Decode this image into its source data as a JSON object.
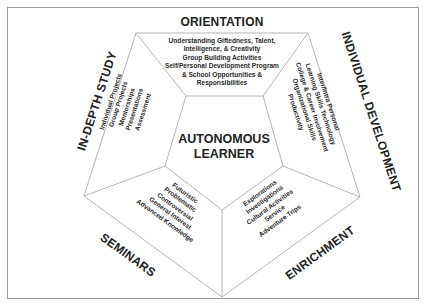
{
  "diagram": {
    "type": "pentagon-model",
    "center": {
      "line1": "AUTONOMOUS",
      "line2": "LEARNER"
    },
    "sections": [
      {
        "name": "orientation",
        "title": "ORIENTATION",
        "items": [
          "Understanding Giftedness, Talent,",
          "Intelligence, & Creativity",
          "Group Building Activities",
          "Self/Personal Development Program",
          "& School Opportunities &",
          "Responsibilities"
        ]
      },
      {
        "name": "individual-development",
        "title": "INDIVIDUAL DEVELOPMENT",
        "items": [
          "Inter/Intra Personal",
          "Learning Skills Technology",
          "College & Career Involvement",
          "Organizational Skills",
          "Productivity"
        ]
      },
      {
        "name": "enrichment",
        "title": "ENRICHMENT",
        "items": [
          "Explorations",
          "Investigations",
          "Cultural Activities",
          "Service",
          "Adventure Trips"
        ]
      },
      {
        "name": "seminars",
        "title": "SEMINARS",
        "items": [
          "Futuristic",
          "Problematic",
          "Controversial",
          "General Interest",
          "Advanced Knowledge"
        ]
      },
      {
        "name": "in-depth-study",
        "title": "IN-DEPTH STUDY",
        "items": [
          "Individual Projects",
          "Group Projects",
          "Mentorships",
          "Presentations",
          "Assessment"
        ]
      }
    ],
    "colors": {
      "line": "#b5b5b5",
      "text": "#222222",
      "frame": "#9a9a9a"
    }
  }
}
